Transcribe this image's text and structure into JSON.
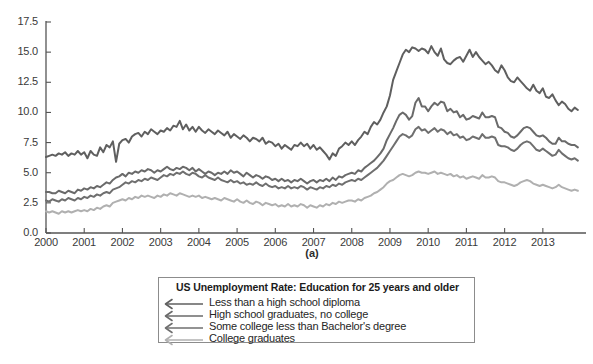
{
  "chart_data": {
    "type": "line",
    "title": "US Unemployment Rate: Education for 25 years and older",
    "subcaption": "(a)",
    "xlabel": "",
    "ylabel": "",
    "grid": false,
    "legend_position": "below-plot-center",
    "xlim": [
      2000.0,
      2013.92
    ],
    "ylim": [
      0.0,
      17.5
    ],
    "ytick_labels": [
      "0.0",
      "2.5",
      "5.0",
      "7.5",
      "10.0",
      "12.5",
      "15.0",
      "17.5"
    ],
    "ytick_values": [
      0.0,
      2.5,
      5.0,
      7.5,
      10.0,
      12.5,
      15.0,
      17.5
    ],
    "xtick_labels": [
      "2000",
      "2001",
      "2002",
      "2003",
      "2004",
      "2005",
      "2006",
      "2007",
      "2008",
      "2009",
      "2010",
      "2011",
      "2012",
      "2013"
    ],
    "xtick_values": [
      2000,
      2001,
      2002,
      2003,
      2004,
      2005,
      2006,
      2007,
      2008,
      2009,
      2010,
      2011,
      2012,
      2013
    ],
    "x_start": 2000.0,
    "x_step": 0.08333,
    "series": [
      {
        "name": "Less than a high school diploma",
        "color": "#5f5f5f",
        "width": 2.0,
        "values": [
          6.3,
          6.4,
          6.5,
          6.4,
          6.6,
          6.5,
          6.7,
          6.4,
          6.6,
          6.5,
          6.8,
          6.5,
          6.7,
          6.2,
          6.8,
          6.5,
          6.4,
          7.1,
          6.7,
          7.3,
          7.1,
          7.6,
          5.9,
          7.4,
          7.7,
          7.8,
          7.5,
          8.0,
          8.2,
          8.3,
          8.0,
          8.4,
          8.2,
          8.6,
          8.4,
          8.2,
          8.5,
          8.4,
          8.7,
          8.5,
          8.9,
          8.8,
          9.3,
          8.6,
          9.0,
          8.5,
          8.8,
          8.4,
          8.8,
          8.5,
          8.3,
          8.6,
          8.4,
          8.2,
          8.5,
          8.3,
          8.1,
          8.4,
          7.9,
          8.2,
          8.0,
          7.8,
          8.1,
          7.9,
          7.6,
          7.9,
          7.8,
          7.6,
          7.9,
          7.4,
          7.6,
          7.5,
          7.2,
          7.4,
          7.0,
          7.3,
          7.1,
          6.9,
          7.3,
          7.2,
          7.5,
          7.2,
          7.4,
          7.0,
          7.3,
          6.9,
          7.1,
          6.8,
          6.5,
          6.1,
          6.6,
          6.4,
          7.0,
          7.2,
          7.5,
          7.3,
          7.6,
          7.3,
          7.7,
          8.0,
          8.4,
          8.2,
          8.8,
          9.2,
          9.0,
          9.4,
          10.0,
          10.5,
          11.4,
          12.7,
          13.4,
          14.1,
          14.8,
          15.2,
          15.0,
          15.4,
          15.3,
          15.1,
          15.3,
          15.2,
          14.9,
          15.5,
          15.0,
          14.7,
          15.3,
          14.4,
          14.1,
          14.0,
          14.3,
          14.5,
          14.6,
          14.2,
          14.7,
          15.2,
          14.6,
          15.0,
          14.6,
          14.3,
          14.0,
          14.2,
          13.9,
          13.5,
          13.3,
          13.9,
          13.5,
          12.9,
          12.6,
          12.5,
          12.9,
          12.6,
          12.3,
          12.0,
          11.8,
          12.3,
          11.8,
          11.6,
          12.0,
          11.3,
          11.2,
          11.5,
          11.0,
          10.6,
          10.9,
          10.7,
          10.3,
          10.1,
          10.4,
          10.2
        ]
      },
      {
        "name": "High school graduates, no college",
        "color": "#6a6a6a",
        "width": 2.0,
        "values": [
          3.4,
          3.4,
          3.3,
          3.3,
          3.5,
          3.4,
          3.3,
          3.5,
          3.4,
          3.3,
          3.6,
          3.5,
          3.7,
          3.6,
          3.8,
          3.7,
          3.9,
          3.8,
          4.0,
          4.2,
          4.1,
          4.4,
          4.6,
          4.7,
          4.9,
          4.7,
          5.0,
          4.9,
          5.1,
          5.0,
          5.2,
          5.1,
          5.3,
          5.2,
          5.0,
          5.2,
          5.1,
          5.3,
          5.5,
          5.3,
          5.2,
          5.4,
          5.3,
          5.5,
          5.4,
          5.2,
          5.4,
          5.1,
          5.3,
          5.1,
          4.9,
          5.1,
          5.0,
          4.8,
          5.0,
          4.9,
          5.1,
          4.9,
          5.2,
          5.0,
          5.1,
          4.9,
          4.7,
          5.0,
          4.8,
          4.6,
          4.8,
          4.7,
          4.5,
          4.7,
          4.6,
          4.4,
          4.5,
          4.3,
          4.5,
          4.3,
          4.4,
          4.2,
          4.4,
          4.3,
          4.5,
          4.3,
          4.1,
          4.3,
          4.4,
          4.2,
          4.4,
          4.3,
          4.5,
          4.3,
          4.6,
          4.4,
          4.7,
          4.6,
          4.8,
          4.9,
          5.0,
          4.9,
          5.2,
          5.1,
          5.4,
          5.6,
          5.8,
          6.0,
          6.3,
          6.6,
          7.0,
          7.7,
          8.2,
          8.7,
          9.3,
          9.8,
          10.0,
          9.8,
          9.4,
          9.7,
          10.8,
          11.2,
          10.5,
          10.5,
          10.1,
          10.5,
          10.8,
          10.6,
          10.9,
          10.8,
          10.1,
          10.3,
          10.0,
          10.1,
          9.6,
          9.8,
          9.4,
          9.5,
          9.7,
          9.6,
          9.5,
          10.0,
          9.6,
          9.6,
          9.7,
          9.6,
          8.8,
          8.7,
          8.4,
          8.3,
          8.0,
          7.9,
          8.1,
          8.4,
          8.7,
          8.8,
          8.7,
          8.4,
          8.1,
          8.0,
          8.1,
          7.9,
          7.6,
          7.4,
          7.4,
          7.9,
          7.6,
          7.6,
          7.4,
          7.3,
          7.3,
          7.1
        ]
      },
      {
        "name": "Some college less than Bachelor's degree",
        "color": "#6f6f6f",
        "width": 2.0,
        "values": [
          2.7,
          2.6,
          2.8,
          2.7,
          2.6,
          2.8,
          2.7,
          2.9,
          2.8,
          2.7,
          2.9,
          2.8,
          3.0,
          2.9,
          3.1,
          3.0,
          3.2,
          3.1,
          3.3,
          3.4,
          3.3,
          3.6,
          3.7,
          3.8,
          4.0,
          4.2,
          4.1,
          4.3,
          4.2,
          4.4,
          4.3,
          4.5,
          4.4,
          4.6,
          4.5,
          4.4,
          4.6,
          4.8,
          4.7,
          4.9,
          4.8,
          5.0,
          4.9,
          5.1,
          4.9,
          4.8,
          5.0,
          4.9,
          4.7,
          4.6,
          4.8,
          4.6,
          4.5,
          4.4,
          4.6,
          4.4,
          4.3,
          4.2,
          4.4,
          4.2,
          4.3,
          4.1,
          4.2,
          4.0,
          4.1,
          4.0,
          4.2,
          4.0,
          3.9,
          4.1,
          3.9,
          3.8,
          3.9,
          3.7,
          3.8,
          3.7,
          3.9,
          3.7,
          3.8,
          3.7,
          3.9,
          3.8,
          3.6,
          3.8,
          3.7,
          3.6,
          3.8,
          3.7,
          3.9,
          3.8,
          4.0,
          3.9,
          4.1,
          4.0,
          4.2,
          4.3,
          4.4,
          4.3,
          4.5,
          4.4,
          4.6,
          4.8,
          5.0,
          5.2,
          5.4,
          5.7,
          6.0,
          6.4,
          6.8,
          7.2,
          7.6,
          8.0,
          8.2,
          8.1,
          7.9,
          8.1,
          8.6,
          8.8,
          8.5,
          8.6,
          8.3,
          8.5,
          8.7,
          8.4,
          8.6,
          8.5,
          8.2,
          8.4,
          8.1,
          8.2,
          7.9,
          8.0,
          7.7,
          7.8,
          8.0,
          7.9,
          7.8,
          8.2,
          7.9,
          7.9,
          8.0,
          7.9,
          7.3,
          7.2,
          7.2,
          7.1,
          6.9,
          6.8,
          7.0,
          7.3,
          7.5,
          7.6,
          7.5,
          7.2,
          6.9,
          6.8,
          7.0,
          6.8,
          6.6,
          6.4,
          6.5,
          6.9,
          6.6,
          6.4,
          6.2,
          6.1,
          6.2,
          6.0
        ]
      },
      {
        "name": "College graduates",
        "color": "#b0b0b0",
        "width": 2.0,
        "values": [
          1.8,
          1.7,
          1.8,
          1.7,
          1.6,
          1.8,
          1.7,
          1.8,
          1.7,
          1.8,
          1.9,
          1.8,
          1.9,
          1.8,
          2.0,
          1.9,
          2.1,
          2.0,
          2.2,
          2.3,
          2.2,
          2.5,
          2.6,
          2.7,
          2.8,
          2.7,
          2.9,
          2.8,
          3.0,
          2.9,
          3.1,
          3.0,
          3.1,
          3.0,
          2.9,
          3.1,
          3.0,
          3.2,
          3.1,
          3.3,
          3.2,
          3.1,
          3.3,
          3.2,
          3.1,
          3.0,
          3.1,
          3.0,
          3.1,
          2.9,
          3.0,
          2.9,
          2.8,
          2.9,
          2.8,
          2.7,
          2.9,
          2.8,
          2.7,
          2.6,
          2.8,
          2.6,
          2.5,
          2.7,
          2.5,
          2.4,
          2.6,
          2.5,
          2.3,
          2.5,
          2.4,
          2.3,
          2.4,
          2.2,
          2.3,
          2.2,
          2.4,
          2.2,
          2.3,
          2.2,
          2.4,
          2.3,
          2.1,
          2.3,
          2.2,
          2.1,
          2.3,
          2.2,
          2.4,
          2.3,
          2.5,
          2.4,
          2.6,
          2.5,
          2.6,
          2.7,
          2.7,
          2.6,
          2.8,
          2.7,
          2.9,
          3.0,
          3.1,
          3.3,
          3.4,
          3.6,
          3.8,
          4.1,
          4.3,
          4.4,
          4.6,
          4.8,
          4.9,
          4.8,
          4.7,
          4.8,
          5.0,
          5.1,
          5.0,
          5.0,
          4.9,
          5.0,
          5.1,
          4.9,
          5.0,
          4.9,
          4.8,
          4.9,
          4.7,
          4.8,
          4.6,
          4.7,
          4.5,
          4.6,
          4.7,
          4.6,
          4.5,
          4.8,
          4.6,
          4.6,
          4.7,
          4.6,
          4.3,
          4.2,
          4.2,
          4.1,
          4.0,
          3.9,
          4.0,
          4.2,
          4.3,
          4.4,
          4.3,
          4.1,
          4.0,
          3.9,
          4.0,
          3.9,
          3.8,
          3.7,
          3.8,
          4.0,
          3.8,
          3.7,
          3.6,
          3.5,
          3.6,
          3.5
        ]
      }
    ]
  },
  "legend": {
    "title": "US Unemployment Rate: Education for 25 years and older",
    "entries": [
      {
        "label": "Less than a high school diploma",
        "color": "#5f5f5f"
      },
      {
        "label": "High school graduates, no college",
        "color": "#6a6a6a"
      },
      {
        "label": "Some college less than Bachelor's degree",
        "color": "#6f6f6f"
      },
      {
        "label": "College graduates",
        "color": "#b0b0b0"
      }
    ]
  },
  "axis": {
    "color": "#555555",
    "tick_color": "#555555",
    "label_color": "#3a3a3a"
  }
}
